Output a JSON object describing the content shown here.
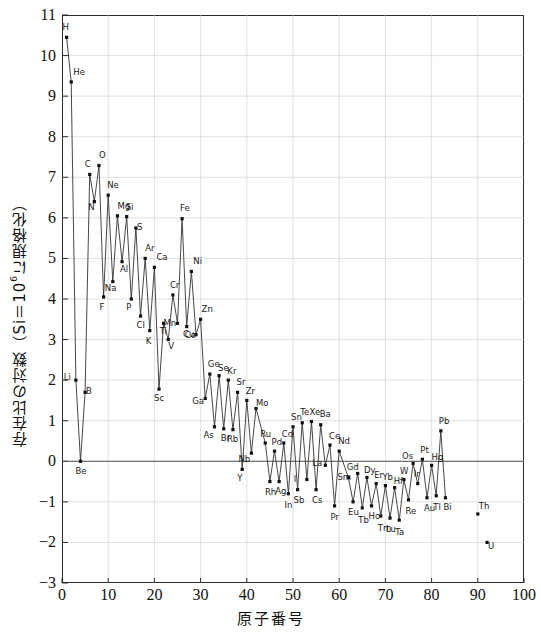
{
  "chart_data": {
    "type": "scatter",
    "title": "",
    "xlabel": "原子番号",
    "ylabel_parts": {
      "pre": "存在比の対数（Si＝10",
      "sup": "6",
      "post": "に規格化）"
    },
    "ylabel": "存在比の対数（Si＝10⁶に規格化）",
    "xlim": [
      0,
      100
    ],
    "ylim": [
      -3,
      11
    ],
    "xticks": [
      0,
      10,
      20,
      30,
      40,
      50,
      60,
      70,
      80,
      90,
      100
    ],
    "yticks": [
      -3,
      -2,
      -1,
      0,
      1,
      2,
      3,
      4,
      5,
      6,
      7,
      8,
      9,
      10,
      11
    ],
    "grid": true,
    "legend": "none",
    "series_name": "太陽系元素存在度",
    "connected_through_z": 83,
    "x": [
      1,
      2,
      3,
      4,
      5,
      6,
      7,
      8,
      9,
      10,
      11,
      12,
      13,
      14,
      15,
      16,
      17,
      18,
      19,
      20,
      21,
      22,
      23,
      24,
      25,
      26,
      27,
      28,
      29,
      30,
      31,
      32,
      33,
      34,
      35,
      36,
      37,
      38,
      39,
      40,
      41,
      42,
      44,
      45,
      46,
      47,
      48,
      49,
      50,
      51,
      52,
      53,
      54,
      55,
      56,
      57,
      58,
      59,
      60,
      62,
      63,
      64,
      65,
      66,
      67,
      68,
      69,
      70,
      71,
      72,
      73,
      74,
      75,
      76,
      77,
      78,
      79,
      80,
      81,
      82,
      83,
      90,
      92
    ],
    "values": [
      10.45,
      9.35,
      2.0,
      0.0,
      1.7,
      7.07,
      6.4,
      7.29,
      4.05,
      6.56,
      4.43,
      6.05,
      4.92,
      6.03,
      4.0,
      5.75,
      3.58,
      5.0,
      3.22,
      4.78,
      1.78,
      3.4,
      3.0,
      4.1,
      3.4,
      5.98,
      3.32,
      4.68,
      3.12,
      3.5,
      1.55,
      2.15,
      0.85,
      2.11,
      0.8,
      2.0,
      0.78,
      1.7,
      -0.2,
      1.5,
      0.2,
      1.3,
      0.45,
      -0.5,
      0.25,
      -0.5,
      0.45,
      -0.8,
      0.85,
      -0.7,
      0.95,
      -0.45,
      0.98,
      -0.7,
      0.9,
      -0.1,
      0.4,
      -1.1,
      0.25,
      -0.4,
      -1.0,
      -0.3,
      -1.15,
      -0.4,
      -1.1,
      -0.55,
      -1.35,
      -0.6,
      -1.4,
      -0.65,
      -1.45,
      -0.45,
      -0.95,
      -0.05,
      -0.55,
      0.05,
      -0.9,
      -0.1,
      -0.85,
      0.75,
      -0.9,
      -1.3,
      -2.0
    ],
    "labels": [
      "H",
      "He",
      "Li",
      "Be",
      "B",
      "C",
      "N",
      "O",
      "F",
      "Ne",
      "Na",
      "Mg",
      "Al",
      "Si",
      "P",
      "S",
      "Cl",
      "Ar",
      "K",
      "Ca",
      "Sc",
      "Ti",
      "V",
      "Cr",
      "Mn",
      "Fe",
      "Co",
      "Ni",
      "Cu",
      "Zn",
      "Ga",
      "Ge",
      "As",
      "Se",
      "Br",
      "Kr",
      "Rb",
      "Sr",
      "Y",
      "Zr",
      "Nb",
      "Mo",
      "Ru",
      "Rh",
      "Pd",
      "Ag",
      "Cd",
      "In",
      "Sn",
      "Sb",
      "Te",
      "I",
      "Xe",
      "Cs",
      "Ba",
      "La",
      "Ce",
      "Pr",
      "Nd",
      "Sm",
      "Eu",
      "Gd",
      "Tb",
      "Dy",
      "Ho",
      "Er",
      "Tm",
      "Yb",
      "Lu",
      "Hf",
      "Ta",
      "W",
      "Re",
      "Os",
      "Ir",
      "Pt",
      "Au",
      "Hg",
      "Tl",
      "Pb",
      "Bi",
      "Th",
      "U"
    ],
    "label_offsets": [
      [
        -2,
        -11
      ],
      [
        4,
        -11
      ],
      [
        -10,
        -4
      ],
      [
        -3,
        9
      ],
      [
        3,
        -2
      ],
      [
        -3,
        -11
      ],
      [
        -4,
        4
      ],
      [
        2,
        -12
      ],
      [
        -2,
        9
      ],
      [
        1,
        -11
      ],
      [
        -6,
        5
      ],
      [
        2,
        -11
      ],
      [
        0,
        6
      ],
      [
        1,
        -11
      ],
      [
        -3,
        7
      ],
      [
        3,
        -2
      ],
      [
        -2,
        8
      ],
      [
        2,
        -11
      ],
      [
        -2,
        9
      ],
      [
        4,
        -11
      ],
      [
        -3,
        8
      ],
      [
        -2,
        7
      ],
      [
        2,
        5
      ],
      [
        -1,
        -11
      ],
      [
        -12,
        -1
      ],
      [
        0,
        -12
      ],
      [
        0,
        7
      ],
      [
        4,
        -11
      ],
      [
        -11,
        -2
      ],
      [
        3,
        -11
      ],
      [
        -11,
        2
      ],
      [
        0,
        -11
      ],
      [
        -9,
        7
      ],
      [
        1,
        -9
      ],
      [
        -1,
        8
      ],
      [
        1,
        -10
      ],
      [
        -4,
        8
      ],
      [
        1,
        -11
      ],
      [
        -3,
        8
      ],
      [
        1,
        -10
      ],
      [
        -11,
        5
      ],
      [
        2,
        -7
      ],
      [
        -3,
        -10
      ],
      [
        -3,
        9
      ],
      [
        -1,
        -10
      ],
      [
        -2,
        8
      ],
      [
        0,
        -10
      ],
      [
        -2,
        10
      ],
      [
        0,
        -11
      ],
      [
        -2,
        9
      ],
      [
        0,
        -12
      ],
      [
        -11,
        -2
      ],
      [
        0,
        -11
      ],
      [
        -2,
        9
      ],
      [
        1,
        -12
      ],
      [
        -11,
        -3
      ],
      [
        1,
        -10
      ],
      [
        -2,
        10
      ],
      [
        1,
        -11
      ],
      [
        -9,
        -2
      ],
      [
        -3,
        9
      ],
      [
        -9,
        -7
      ],
      [
        -2,
        11
      ],
      [
        -1,
        -9
      ],
      [
        -1,
        9
      ],
      [
        0,
        -10
      ],
      [
        -1,
        11
      ],
      [
        -1,
        -10
      ],
      [
        -2,
        10
      ],
      [
        1,
        -8
      ],
      [
        -2,
        11
      ],
      [
        -2,
        -10
      ],
      [
        -1,
        10
      ],
      [
        -9,
        -8
      ],
      [
        -2,
        -11
      ],
      [
        0,
        -10
      ],
      [
        -1,
        9
      ],
      [
        2,
        -9
      ],
      [
        -1,
        10
      ],
      [
        0,
        -11
      ],
      [
        0,
        8
      ],
      [
        3,
        -9
      ],
      [
        3,
        3
      ]
    ]
  }
}
